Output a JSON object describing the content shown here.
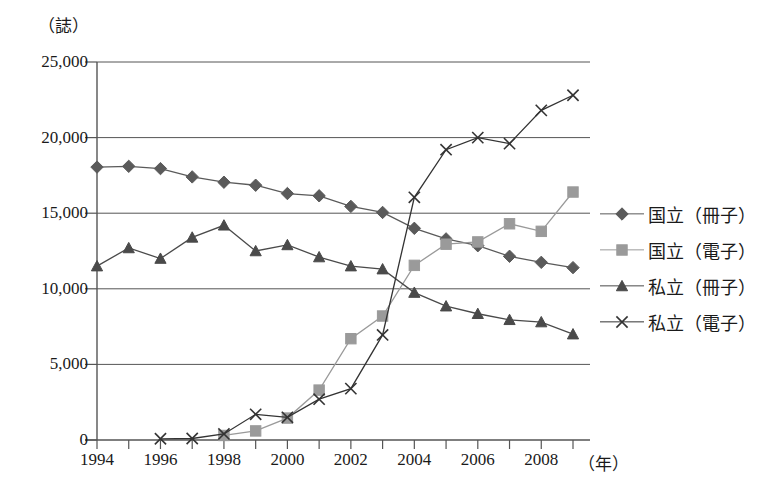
{
  "chart_data": {
    "type": "line",
    "title": "",
    "subtitle": "",
    "xlabel": "（年）",
    "ylabel": "（誌）",
    "ylim": [
      0,
      25000
    ],
    "xlim": [
      1994,
      2009
    ],
    "grid": true,
    "legend_position": "right",
    "yticks": [
      0,
      5000,
      10000,
      15000,
      20000,
      25000
    ],
    "ytick_labels": [
      "0",
      "5,000",
      "10,000",
      "15,000",
      "20,000",
      "25,000"
    ],
    "x": [
      1994,
      1995,
      1996,
      1997,
      1998,
      1999,
      2000,
      2001,
      2002,
      2003,
      2004,
      2005,
      2006,
      2007,
      2008,
      2009
    ],
    "xtick_labels": [
      "1994",
      "1996",
      "1998",
      "2000",
      "2002",
      "2004",
      "2006",
      "2008"
    ],
    "xticks": [
      1994,
      1996,
      1998,
      2000,
      2002,
      2004,
      2006,
      2008
    ],
    "series": [
      {
        "name": "国立（冊子）",
        "marker": "diamond",
        "color": "#5a5a5a",
        "values": [
          18050,
          18100,
          17950,
          17400,
          17050,
          16850,
          16300,
          16150,
          15450,
          15050,
          14000,
          13300,
          12850,
          12150,
          11750,
          11400
        ]
      },
      {
        "name": "国立（電子）",
        "marker": "square",
        "color": "#9a9a9a",
        "values": [
          null,
          null,
          null,
          null,
          300,
          600,
          1450,
          3300,
          6700,
          8200,
          11550,
          12950,
          13100,
          14300,
          13800,
          16400
        ]
      },
      {
        "name": "私立（冊子）",
        "marker": "triangle",
        "color": "#4a4a4a",
        "values": [
          11500,
          12700,
          12000,
          13400,
          14200,
          12500,
          12900,
          12100,
          11500,
          11300,
          9750,
          8850,
          8350,
          7950,
          7800,
          7000
        ]
      },
      {
        "name": "私立（電子）",
        "marker": "x",
        "color": "#333333",
        "values": [
          null,
          null,
          80,
          100,
          400,
          1700,
          1500,
          2700,
          3400,
          6950,
          16050,
          19200,
          20000,
          19600,
          21800,
          22800
        ]
      }
    ]
  },
  "axis": {
    "unit_y": "（誌）",
    "unit_x": "（年）"
  }
}
